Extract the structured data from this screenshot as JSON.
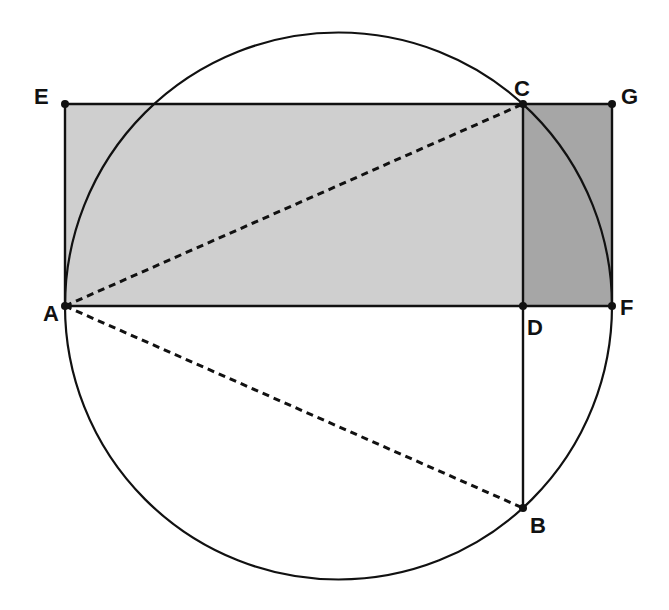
{
  "figure": {
    "type": "geometry-diagram",
    "colors": {
      "background": "#ffffff",
      "stroke": "#111111",
      "rect_light_fill": "#cfcfcf",
      "rect_dark_fill": "#a6a6a6"
    },
    "points": {
      "A": {
        "label": "A",
        "x": 65,
        "y": 306
      },
      "B": {
        "label": "B",
        "x": 523,
        "y": 508
      },
      "C": {
        "label": "C",
        "x": 523,
        "y": 104
      },
      "D": {
        "label": "D",
        "x": 523,
        "y": 306
      },
      "E": {
        "label": "E",
        "x": 65,
        "y": 104
      },
      "F": {
        "label": "F",
        "x": 612,
        "y": 306
      },
      "G": {
        "label": "G",
        "x": 612,
        "y": 104
      }
    },
    "circle": {
      "cx": 338.5,
      "cy": 306,
      "r": 273.5
    },
    "regions": [
      {
        "name": "rectangle-AECD",
        "vertices": [
          "A",
          "E",
          "C",
          "D"
        ],
        "shade": "light"
      },
      {
        "name": "rectangle-DCGF",
        "vertices": [
          "D",
          "C",
          "G",
          "F"
        ],
        "shade": "dark"
      }
    ],
    "segments": [
      {
        "from": "A",
        "to": "C",
        "style": "dashed"
      },
      {
        "from": "A",
        "to": "B",
        "style": "dashed"
      },
      {
        "from": "C",
        "to": "B",
        "style": "solid"
      },
      {
        "from": "A",
        "to": "F",
        "style": "solid"
      },
      {
        "from": "E",
        "to": "G",
        "style": "solid"
      },
      {
        "from": "A",
        "to": "E",
        "style": "solid"
      },
      {
        "from": "G",
        "to": "F",
        "style": "solid"
      }
    ],
    "labels": {
      "A": "A",
      "B": "B",
      "C": "C",
      "D": "D",
      "E": "E",
      "F": "F",
      "G": "G"
    }
  }
}
